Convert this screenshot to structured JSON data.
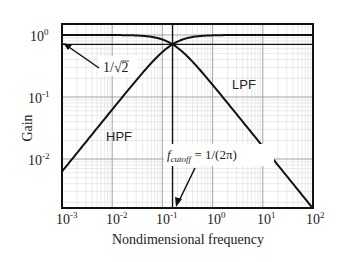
{
  "chart_data": {
    "type": "line",
    "title": "",
    "xlabel": "Nondimensional frequency",
    "ylabel": "Gain",
    "xscale": "log",
    "yscale": "log",
    "xlim": [
      0.001,
      100
    ],
    "ylim": [
      0.0016,
      1.3
    ],
    "grid": true,
    "x_ticks": [
      "10^-3",
      "10^-2",
      "10^-1",
      "10^0",
      "10^1",
      "10^2"
    ],
    "y_ticks": [
      "10^-2",
      "10^-1",
      "10^0"
    ],
    "series": [
      {
        "name": "LPF",
        "formula": "1/sqrt(1+(2*pi*f)^2)",
        "x": [
          0.001,
          0.01,
          0.1,
          0.159,
          1,
          10,
          100
        ],
        "values": [
          1.0,
          0.998,
          0.847,
          0.707,
          0.157,
          0.0159,
          0.00159
        ]
      },
      {
        "name": "HPF",
        "formula": "2*pi*f/sqrt(1+(2*pi*f)^2)",
        "x": [
          0.001,
          0.01,
          0.1,
          0.159,
          1,
          10,
          100
        ],
        "values": [
          0.00628,
          0.0627,
          0.532,
          0.707,
          0.988,
          1.0,
          1.0
        ]
      }
    ],
    "annotations": [
      {
        "text": "1/√2",
        "target": "horizontal line at gain 0.707"
      },
      {
        "text": "f_cutoff = 1/(2π)",
        "target": "vertical line at frequency 0.159"
      }
    ],
    "reference_lines": {
      "horizontal": 0.7071,
      "vertical": 0.15915
    }
  },
  "labels": {
    "xlabel": "Nondimensional frequency",
    "ylabel": "Gain",
    "lpf": "LPF",
    "hpf": "HPF",
    "inv_sqrt2_prefix": "1/",
    "inv_sqrt2_radicand": "2",
    "fcut_f": "f",
    "fcut_sub": "cutoff",
    "fcut_rhs": " = 1/(2π)",
    "xticks": [
      {
        "base": "10",
        "exp": "-3"
      },
      {
        "base": "10",
        "exp": "-2"
      },
      {
        "base": "10",
        "exp": "-1"
      },
      {
        "base": "10",
        "exp": "0"
      },
      {
        "base": "10",
        "exp": "1"
      },
      {
        "base": "10",
        "exp": "2"
      }
    ],
    "yticks": [
      {
        "base": "10",
        "exp": "0"
      },
      {
        "base": "10",
        "exp": "-1"
      },
      {
        "base": "10",
        "exp": "-2"
      }
    ]
  },
  "colors": {
    "curve": "#111111",
    "axis": "#111111",
    "grid_major": "#9a9a9a",
    "grid_minor": "#dcdcdc"
  }
}
